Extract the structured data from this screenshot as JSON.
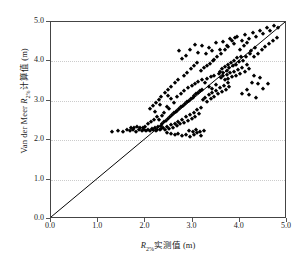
{
  "chart_data": {
    "type": "scatter",
    "title": "",
    "xlabel": "R2%实测值 (m)",
    "ylabel": "Van der Meer R2%计算值 (m)",
    "xlabel_parts": {
      "symbol": "R",
      "subscript": "2%",
      "rest": "实测值 (m)"
    },
    "ylabel_parts": {
      "prefix": "Van der Meer ",
      "symbol": "R",
      "subscript": "2%",
      "rest": "计算值 (m)"
    },
    "xlim": [
      0.0,
      5.0
    ],
    "ylim": [
      0.0,
      5.0
    ],
    "xticks": [
      "0.0",
      "1.0",
      "2.0",
      "3.0",
      "4.0",
      "5.0"
    ],
    "yticks": [
      "0.0",
      "1.0",
      "2.0",
      "3.0",
      "4.0",
      "5.0"
    ],
    "xtick_values": [
      0.0,
      1.0,
      2.0,
      3.0,
      4.0,
      5.0
    ],
    "ytick_values": [
      0.0,
      1.0,
      2.0,
      3.0,
      4.0,
      5.0
    ],
    "grid": {
      "horizontal": true,
      "vertical": false,
      "style": "dotted",
      "color": "#cccccc"
    },
    "legend": {
      "visible": false,
      "position": "none"
    },
    "marker": {
      "shape": "diamond",
      "color": "#000000",
      "size": 3.4
    },
    "reference_line": {
      "label": "1:1 line",
      "from": [
        0.0,
        0.0
      ],
      "to": [
        5.0,
        5.0
      ],
      "color": "#000000",
      "width": 1
    },
    "series": [
      {
        "name": "Van der Meer 计算值 vs 实测值",
        "color": "#000000",
        "points": [
          [
            1.3,
            2.22
          ],
          [
            1.42,
            2.24
          ],
          [
            1.52,
            2.22
          ],
          [
            1.6,
            2.25
          ],
          [
            1.68,
            2.23
          ],
          [
            1.74,
            2.26
          ],
          [
            1.8,
            2.22
          ],
          [
            1.86,
            2.25
          ],
          [
            1.92,
            2.24
          ],
          [
            1.97,
            2.27
          ],
          [
            2.02,
            2.23
          ],
          [
            2.06,
            2.26
          ],
          [
            2.1,
            2.24
          ],
          [
            2.13,
            2.28
          ],
          [
            2.17,
            2.25
          ],
          [
            2.2,
            2.3
          ],
          [
            2.22,
            2.24
          ],
          [
            2.25,
            2.27
          ],
          [
            2.27,
            2.33
          ],
          [
            2.3,
            2.25
          ],
          [
            2.32,
            2.36
          ],
          [
            2.34,
            2.28
          ],
          [
            2.36,
            2.4
          ],
          [
            2.38,
            2.31
          ],
          [
            2.4,
            2.45
          ],
          [
            2.42,
            2.26
          ],
          [
            2.44,
            2.5
          ],
          [
            2.46,
            2.34
          ],
          [
            2.48,
            2.55
          ],
          [
            2.5,
            2.29
          ],
          [
            2.52,
            2.6
          ],
          [
            2.54,
            2.38
          ],
          [
            2.56,
            2.64
          ],
          [
            2.58,
            2.32
          ],
          [
            2.6,
            2.68
          ],
          [
            2.62,
            2.42
          ],
          [
            2.64,
            2.72
          ],
          [
            2.66,
            2.36
          ],
          [
            2.68,
            2.75
          ],
          [
            2.7,
            2.46
          ],
          [
            2.72,
            2.8
          ],
          [
            2.74,
            2.4
          ],
          [
            2.76,
            2.84
          ],
          [
            2.78,
            2.52
          ],
          [
            2.8,
            2.88
          ],
          [
            2.82,
            2.44
          ],
          [
            2.84,
            2.92
          ],
          [
            2.86,
            2.58
          ],
          [
            2.88,
            2.96
          ],
          [
            2.9,
            2.48
          ],
          [
            2.92,
            3.0
          ],
          [
            2.94,
            2.64
          ],
          [
            2.96,
            3.04
          ],
          [
            2.98,
            2.54
          ],
          [
            3.0,
            3.08
          ],
          [
            3.02,
            2.7
          ],
          [
            3.04,
            3.12
          ],
          [
            3.06,
            2.6
          ],
          [
            3.08,
            3.16
          ],
          [
            3.1,
            2.76
          ],
          [
            3.12,
            3.2
          ],
          [
            3.14,
            2.66
          ],
          [
            3.16,
            3.24
          ],
          [
            3.18,
            2.82
          ],
          [
            3.2,
            3.28
          ],
          [
            2.45,
            2.18
          ],
          [
            2.55,
            2.15
          ],
          [
            2.62,
            2.12
          ],
          [
            2.7,
            2.16
          ],
          [
            2.78,
            2.1
          ],
          [
            2.86,
            2.14
          ],
          [
            2.94,
            2.08
          ],
          [
            3.02,
            2.12
          ],
          [
            3.1,
            2.18
          ],
          [
            3.18,
            2.1
          ],
          [
            2.35,
            2.62
          ],
          [
            2.4,
            2.7
          ],
          [
            2.28,
            2.52
          ],
          [
            2.5,
            2.78
          ],
          [
            2.45,
            2.85
          ],
          [
            2.3,
            2.9
          ],
          [
            2.2,
            2.72
          ],
          [
            2.6,
            2.95
          ],
          [
            2.55,
            3.05
          ],
          [
            2.48,
            3.12
          ],
          [
            2.68,
            3.1
          ],
          [
            2.75,
            3.18
          ],
          [
            2.82,
            3.25
          ],
          [
            2.9,
            3.32
          ],
          [
            2.98,
            3.38
          ],
          [
            3.05,
            3.42
          ],
          [
            3.12,
            3.48
          ],
          [
            3.2,
            3.52
          ],
          [
            3.26,
            3.44
          ],
          [
            3.3,
            3.56
          ],
          [
            3.34,
            3.36
          ],
          [
            3.38,
            3.6
          ],
          [
            3.42,
            3.3
          ],
          [
            3.46,
            3.64
          ],
          [
            3.5,
            3.4
          ],
          [
            3.22,
            3.02
          ],
          [
            3.26,
            3.08
          ],
          [
            3.3,
            2.98
          ],
          [
            3.34,
            3.14
          ],
          [
            3.38,
            3.04
          ],
          [
            3.42,
            3.2
          ],
          [
            3.46,
            3.1
          ],
          [
            3.5,
            3.26
          ],
          [
            3.54,
            3.16
          ],
          [
            3.58,
            3.32
          ],
          [
            3.62,
            3.22
          ],
          [
            3.66,
            3.38
          ],
          [
            3.7,
            3.28
          ],
          [
            3.74,
            3.44
          ],
          [
            3.78,
            3.34
          ],
          [
            3.55,
            3.68
          ],
          [
            3.58,
            3.74
          ],
          [
            3.62,
            3.8
          ],
          [
            3.65,
            3.7
          ],
          [
            3.68,
            3.86
          ],
          [
            3.72,
            3.76
          ],
          [
            3.75,
            3.92
          ],
          [
            3.78,
            3.82
          ],
          [
            3.82,
            3.96
          ],
          [
            3.85,
            3.88
          ],
          [
            3.88,
            4.02
          ],
          [
            3.92,
            3.92
          ],
          [
            3.95,
            4.08
          ],
          [
            3.98,
            3.98
          ],
          [
            4.02,
            4.12
          ],
          [
            3.6,
            3.58
          ],
          [
            3.64,
            3.62
          ],
          [
            3.68,
            3.52
          ],
          [
            3.72,
            3.66
          ],
          [
            3.76,
            3.56
          ],
          [
            3.8,
            3.7
          ],
          [
            3.84,
            3.6
          ],
          [
            3.88,
            3.74
          ],
          [
            3.92,
            3.64
          ],
          [
            3.96,
            3.78
          ],
          [
            4.0,
            3.68
          ],
          [
            4.05,
            3.84
          ],
          [
            4.1,
            3.72
          ],
          [
            4.15,
            3.9
          ],
          [
            4.2,
            3.8
          ],
          [
            2.95,
            4.3
          ],
          [
            3.05,
            4.42
          ],
          [
            3.12,
            4.22
          ],
          [
            3.2,
            4.38
          ],
          [
            3.28,
            4.18
          ],
          [
            3.35,
            4.34
          ],
          [
            3.42,
            4.26
          ],
          [
            3.5,
            4.46
          ],
          [
            3.58,
            4.3
          ],
          [
            3.65,
            4.5
          ],
          [
            3.72,
            4.4
          ],
          [
            3.8,
            4.56
          ],
          [
            3.88,
            4.44
          ],
          [
            3.95,
            4.62
          ],
          [
            4.05,
            4.52
          ],
          [
            4.12,
            4.66
          ],
          [
            4.2,
            4.56
          ],
          [
            4.28,
            4.72
          ],
          [
            4.35,
            4.62
          ],
          [
            4.42,
            4.78
          ],
          [
            4.5,
            4.7
          ],
          [
            4.58,
            4.84
          ],
          [
            4.65,
            4.76
          ],
          [
            4.72,
            4.9
          ],
          [
            4.8,
            4.84
          ],
          [
            4.3,
            3.62
          ],
          [
            4.42,
            3.58
          ],
          [
            4.25,
            3.46
          ],
          [
            4.38,
            3.42
          ],
          [
            4.15,
            3.28
          ],
          [
            4.5,
            3.3
          ],
          [
            4.05,
            3.18
          ],
          [
            4.2,
            3.14
          ],
          [
            4.35,
            3.06
          ],
          [
            4.6,
            3.42
          ],
          [
            2.7,
            3.52
          ],
          [
            2.62,
            3.44
          ],
          [
            2.55,
            3.36
          ],
          [
            2.48,
            3.28
          ],
          [
            2.42,
            3.2
          ],
          [
            2.82,
            3.62
          ],
          [
            2.88,
            3.7
          ],
          [
            2.96,
            3.8
          ],
          [
            3.02,
            3.88
          ],
          [
            3.1,
            3.96
          ],
          [
            2.34,
            3.1
          ],
          [
            2.28,
            3.02
          ],
          [
            2.22,
            2.94
          ],
          [
            2.16,
            2.86
          ],
          [
            2.1,
            2.78
          ],
          [
            3.45,
            4.04
          ],
          [
            3.52,
            4.12
          ],
          [
            3.6,
            4.2
          ],
          [
            3.68,
            4.28
          ],
          [
            3.76,
            4.36
          ],
          [
            4.0,
            4.3
          ],
          [
            4.08,
            4.38
          ],
          [
            4.16,
            4.46
          ],
          [
            4.24,
            4.26
          ],
          [
            4.32,
            4.34
          ],
          [
            3.3,
            3.88
          ],
          [
            3.36,
            3.94
          ],
          [
            3.44,
            4.0
          ],
          [
            3.24,
            3.82
          ],
          [
            3.18,
            3.76
          ],
          [
            2.05,
            2.4
          ],
          [
            2.12,
            2.46
          ],
          [
            2.18,
            2.52
          ],
          [
            2.24,
            2.58
          ],
          [
            2.0,
            2.34
          ],
          [
            1.95,
            2.3
          ],
          [
            1.88,
            2.32
          ],
          [
            1.82,
            2.34
          ],
          [
            1.76,
            2.3
          ],
          [
            1.7,
            2.32
          ],
          [
            2.92,
            2.24
          ],
          [
            3.0,
            2.22
          ],
          [
            3.08,
            2.26
          ],
          [
            3.16,
            2.2
          ],
          [
            3.24,
            2.24
          ],
          [
            4.06,
            4.02
          ],
          [
            4.14,
            4.1
          ],
          [
            4.22,
            4.18
          ],
          [
            4.3,
            4.12
          ],
          [
            4.38,
            4.2
          ],
          [
            4.46,
            4.28
          ],
          [
            4.54,
            4.36
          ],
          [
            4.62,
            4.44
          ],
          [
            4.7,
            4.52
          ],
          [
            4.78,
            4.6
          ],
          [
            3.84,
            4.52
          ],
          [
            3.9,
            4.6
          ],
          [
            2.86,
            4.14
          ],
          [
            2.78,
            4.06
          ],
          [
            2.72,
            4.26
          ]
        ]
      }
    ]
  }
}
